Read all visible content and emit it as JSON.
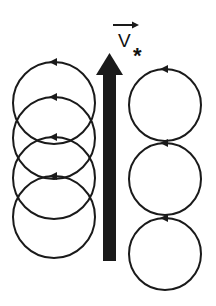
{
  "diagram": {
    "velocity_label": {
      "symbol": "V",
      "subscript": "*",
      "has_vector_arrow": true
    },
    "colors": {
      "stroke": "#1a1a1a",
      "background": "#ffffff"
    },
    "main_arrow": {
      "direction": "up",
      "x_left": 103,
      "x_right": 116,
      "tip_y": 53,
      "head_base_y": 75,
      "bottom_y": 261
    },
    "left_column": {
      "rotation": "counterclockwise",
      "cx": 54,
      "r": 41,
      "circles_cy": [
        103,
        138,
        178,
        217
      ]
    },
    "right_column": {
      "rotation": "counterclockwise",
      "cx": 165,
      "r": 36,
      "circles_cy": [
        105,
        179,
        254
      ]
    }
  }
}
